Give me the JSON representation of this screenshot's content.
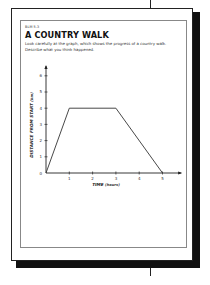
{
  "worksheet": {
    "code": "BLM 5.3",
    "title": "A COUNTRY WALK",
    "instructions": [
      "Look carefully at the graph, which shows the progress of a country walk.",
      "Describe what you think happened."
    ]
  },
  "chart_data": {
    "type": "line",
    "title": "",
    "xlabel": "TIME",
    "xlabel_unit": "(hours)",
    "ylabel": "DISTANCE FROM START",
    "ylabel_unit": "(km)",
    "x_ticks": [
      "0",
      "1",
      "2",
      "3",
      "4",
      "5"
    ],
    "y_ticks": [
      "1",
      "2",
      "3",
      "4",
      "5",
      "6"
    ],
    "xlim": [
      0,
      5.8
    ],
    "ylim": [
      0,
      6.6
    ],
    "grid": false,
    "legend": null,
    "series": [
      {
        "name": "walk",
        "x": [
          0,
          1,
          3,
          5
        ],
        "y": [
          0,
          4,
          4,
          0
        ]
      }
    ]
  },
  "colors": {
    "ink": "#222222",
    "shadow": "#111111",
    "panel_border": "#888888"
  }
}
